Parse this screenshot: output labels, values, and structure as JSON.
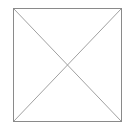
{
  "placeholder": {
    "icon": "image-placeholder-icon",
    "border_color": "#8a8a8a",
    "line_color": "#a0a0a0"
  }
}
